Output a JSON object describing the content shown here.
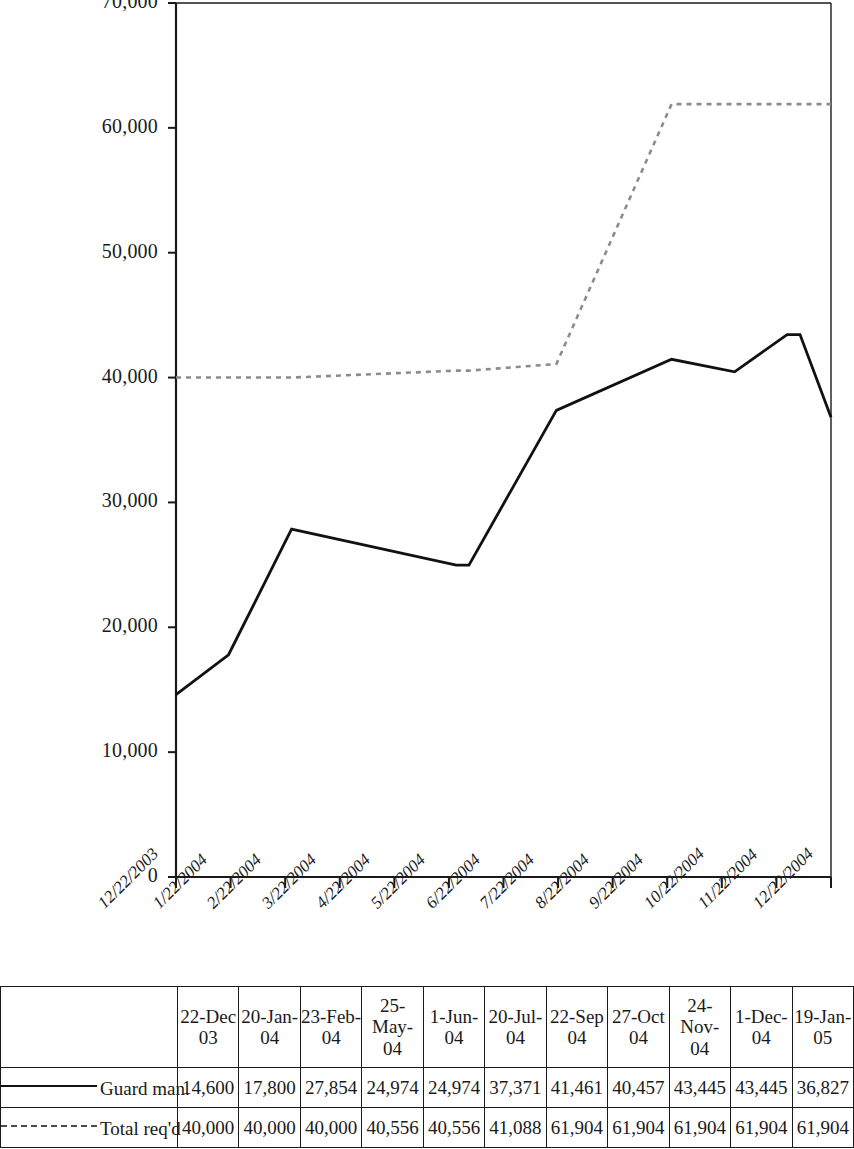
{
  "chart_data": {
    "type": "line",
    "title": "",
    "xlabel": "",
    "ylabel": "",
    "ylim": [
      0,
      70000
    ],
    "yticks": [
      0,
      10000,
      20000,
      30000,
      40000,
      50000,
      60000,
      70000
    ],
    "ytick_labels": [
      "0",
      "10,000",
      "20,000",
      "30,000",
      "40,000",
      "50,000",
      "60,000",
      "70,000"
    ],
    "grid": false,
    "legend_position": "table-left",
    "x_axis_tick_labels": [
      "12/22/2003",
      "1/22/2004",
      "2/22/2004",
      "3/22/2004",
      "4/22/2004",
      "5/22/2004",
      "6/22/2004",
      "7/22/2004",
      "8/22/2004",
      "9/22/2004",
      "10/22/2004",
      "11/22/2004",
      "12/22/2004"
    ],
    "categories": [
      "22-Dec-03",
      "20-Jan-04",
      "23-Feb-04",
      "25-May-04",
      "1-Jun-04",
      "20-Jul-04",
      "22-Sep-04",
      "27-Oct-04",
      "24-Nov-04",
      "1-Dec-04",
      "19-Jan-05"
    ],
    "x_positions_fraction": [
      0.0,
      0.0802,
      0.1764,
      0.4278,
      0.4472,
      0.5807,
      0.7566,
      0.8528,
      0.933,
      0.9527,
      1.0
    ],
    "series": [
      {
        "name": "Guard man.",
        "style": "solid",
        "color": "#111111",
        "values": [
          14600,
          17800,
          27854,
          24974,
          24974,
          37371,
          41461,
          40457,
          43445,
          43445,
          36827
        ]
      },
      {
        "name": "Total req'd",
        "style": "dotted",
        "color": "#8c8c8c",
        "values": [
          40000,
          40000,
          40000,
          40556,
          40556,
          41088,
          61904,
          61904,
          61904,
          61904,
          61904
        ]
      }
    ]
  },
  "table": {
    "headers": [
      "22-Dec-03",
      "20-Jan-04",
      "23-Feb-04",
      "25-May-04",
      "1-Jun-04",
      "20-Jul-04",
      "22-Sep-04",
      "27-Oct-04",
      "24-Nov-04",
      "1-Dec-04",
      "19-Jan-05"
    ],
    "header_lines": [
      [
        "22-Dec",
        "03"
      ],
      [
        "20-Jan-",
        "04"
      ],
      [
        "23-Feb-",
        "04"
      ],
      [
        "25-",
        "May-",
        "04"
      ],
      [
        "1-Jun-",
        "04"
      ],
      [
        "20-Jul-",
        "04"
      ],
      [
        "22-Sep",
        "04"
      ],
      [
        "27-Oct",
        "04"
      ],
      [
        "24-",
        "Nov-",
        "04"
      ],
      [
        "1-Dec-",
        "04"
      ],
      [
        "19-Jan-",
        "05"
      ]
    ],
    "rows": [
      {
        "label": "Guard man.",
        "swatch": "solid-line-swatch",
        "values": [
          "14,600",
          "17,800",
          "27,854",
          "24,974",
          "24,974",
          "37,371",
          "41,461",
          "40,457",
          "43,445",
          "43,445",
          "36,827"
        ]
      },
      {
        "label": "Total req'd",
        "swatch": "dotted-line-swatch",
        "values": [
          "40,000",
          "40,000",
          "40,000",
          "40,556",
          "40,556",
          "41,088",
          "61,904",
          "61,904",
          "61,904",
          "61,904",
          "61,904"
        ]
      }
    ]
  },
  "colors": {
    "axis": "#1a1a1a",
    "series_solid": "#111111",
    "series_dotted": "#8c8c8c",
    "table_border": "#1a1a1a"
  }
}
